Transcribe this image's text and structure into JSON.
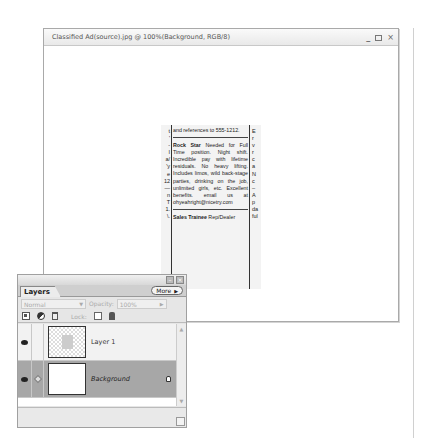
{
  "document_window": {
    "title": "Classified Ad(source).jpg @ 100%(Background, RGB/8)",
    "controls": {
      "minimize": "_",
      "maximize": "□",
      "close": "×"
    }
  },
  "image": {
    "left_col_chars": [
      "t",
      "'",
      "-",
      "I",
      "a/",
      "'y",
      "e",
      "12",
      "—",
      "n",
      "T",
      "1.",
      "\\."
    ],
    "main_col": {
      "top_line": "and references to 555-1212.",
      "ad1_heading": "Rock Star",
      "ad1_body": "Needed for Full Time position. Night shift. Incredible pay with lifetime residuals. No heavy lifting. Includes limos, wild back-stage parties, drinking on the job, unlimited girls, etc. Excellent benefits. email us at ohyeahright@nicetry.com",
      "ad2_heading": "Sales Trainee",
      "ad2_body": "Rep/Dealer"
    },
    "right_col_chars": [
      "E",
      "r",
      "v",
      "r",
      "c",
      "a",
      "N",
      "c",
      "–",
      "A",
      "p",
      "da",
      "ful"
    ]
  },
  "layers_panel": {
    "tab_label": "Layers",
    "more_label": "More",
    "blend_mode": "Normal",
    "opacity_label": "Opacity:",
    "opacity_value": "100%",
    "lock_label": "Lock:",
    "layers": [
      {
        "name": "Layer 1",
        "visible": true,
        "selected": false,
        "locked": false
      },
      {
        "name": "Background",
        "visible": true,
        "selected": true,
        "locked": true
      }
    ]
  }
}
